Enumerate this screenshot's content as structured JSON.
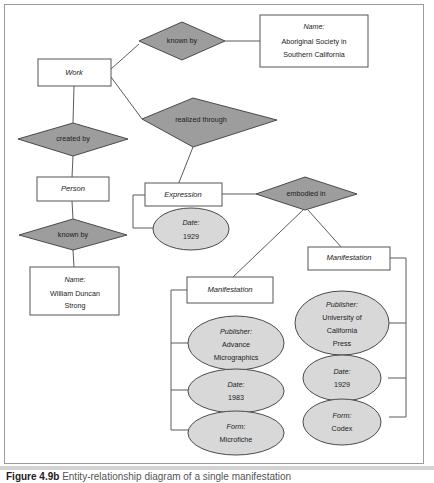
{
  "figure": {
    "label": "Figure",
    "number": "4.9b",
    "caption": "Entity-relationship diagram of a single manifestation"
  },
  "colors": {
    "relationship_fill": "#9d9d9d",
    "attribute_fill": "#d8d8d8",
    "entity_fill": "#ffffff",
    "line": "#5b5b5b",
    "frame": "#9b9b9b",
    "text": "#1c1c1c"
  },
  "diagram": {
    "type": "entity-relationship",
    "entities": [
      {
        "id": "work",
        "label": "Work"
      },
      {
        "id": "person",
        "label": "Person"
      },
      {
        "id": "expression",
        "label": "Expression"
      },
      {
        "id": "manifestation_left",
        "label": "Manifestation"
      },
      {
        "id": "manifestation_right",
        "label": "Manifestation"
      }
    ],
    "relationships": [
      {
        "id": "known_by_work",
        "label": "known by"
      },
      {
        "id": "created_by",
        "label": "created by"
      },
      {
        "id": "realized_through",
        "label": "realized through"
      },
      {
        "id": "known_by_person",
        "label": "known by"
      },
      {
        "id": "embodied_in",
        "label": "embodied in"
      }
    ],
    "attributes": [
      {
        "id": "name_society",
        "shape": "box",
        "lines": [
          "Name:",
          "Aboriginal Society in",
          "Southern California"
        ]
      },
      {
        "id": "name_person",
        "shape": "box",
        "lines": [
          "Name:",
          "William Duncan",
          "Strong"
        ]
      },
      {
        "id": "expression_date",
        "shape": "ellipse",
        "lines": [
          "Date:",
          "1929"
        ]
      },
      {
        "id": "left_publisher",
        "shape": "ellipse",
        "lines": [
          "Publisher:",
          "Advance",
          "Micrographics"
        ]
      },
      {
        "id": "left_date",
        "shape": "ellipse",
        "lines": [
          "Date:",
          "1983"
        ]
      },
      {
        "id": "left_form",
        "shape": "ellipse",
        "lines": [
          "Form:",
          "Microfiche"
        ]
      },
      {
        "id": "right_publisher",
        "shape": "ellipse",
        "lines": [
          "Publisher:",
          "University of",
          "California",
          "Press"
        ]
      },
      {
        "id": "right_date",
        "shape": "ellipse",
        "lines": [
          "Date:",
          "1929"
        ]
      },
      {
        "id": "right_form",
        "shape": "ellipse",
        "lines": [
          "Form:",
          "Codex"
        ]
      }
    ]
  }
}
